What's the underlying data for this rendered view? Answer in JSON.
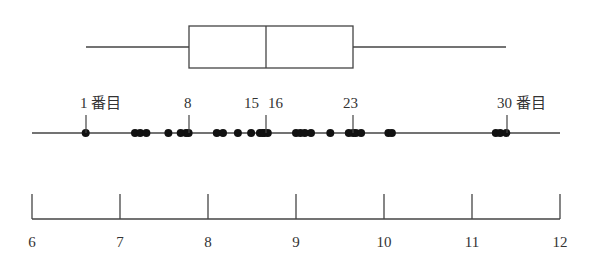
{
  "chart_data": {
    "type": "boxplot_with_dotplot",
    "title": "",
    "xlabel": "",
    "ylabel": "",
    "xlim": [
      6,
      12
    ],
    "x_ticks": [
      6,
      7,
      8,
      9,
      10,
      11,
      12
    ],
    "grid": false,
    "boxplot": {
      "min": 6.61,
      "q1": 7.78,
      "median": 8.66,
      "q3": 9.65,
      "max": 11.39
    },
    "dotplot": {
      "n": 30,
      "values": [
        6.61,
        7.17,
        7.23,
        7.3,
        7.55,
        7.69,
        7.75,
        7.78,
        8.1,
        8.17,
        8.34,
        8.49,
        8.59,
        8.62,
        8.64,
        8.68,
        9.0,
        9.05,
        9.1,
        9.17,
        9.39,
        9.6,
        9.65,
        9.68,
        9.74,
        10.05,
        10.09,
        11.27,
        11.32,
        11.39
      ],
      "annotations": [
        {
          "label": "1 番目",
          "index": 1,
          "value": 6.61
        },
        {
          "label": "8",
          "index": 8,
          "value": 7.78
        },
        {
          "label": "15",
          "index": 15,
          "value": 8.64
        },
        {
          "label": "16",
          "index": 16,
          "value": 8.68
        },
        {
          "label": "23",
          "index": 23,
          "value": 9.65
        },
        {
          "label": "30 番目",
          "index": 30,
          "value": 11.39
        }
      ]
    }
  },
  "axis": {
    "tick_labels": [
      "6",
      "7",
      "8",
      "9",
      "10",
      "11",
      "12"
    ]
  },
  "annotations": {
    "first": "1 番目",
    "eighth": "8",
    "fifteenth": "15",
    "sixteenth": "16",
    "twentythird": "23",
    "thirtieth": "30 番目"
  },
  "colors": {
    "line": "#333333",
    "dot": "#111111",
    "background": "#ffffff"
  }
}
